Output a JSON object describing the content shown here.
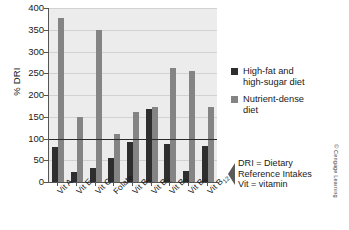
{
  "chart_data": {
    "type": "bar",
    "title": "",
    "xlabel": "",
    "ylabel": "% DRI",
    "ylim": [
      0,
      400
    ],
    "ytick_step": 50,
    "yticks": [
      400,
      350,
      300,
      250,
      200,
      150,
      100,
      50,
      0
    ],
    "grid": true,
    "legend_position": "right",
    "reference_line": {
      "value": 100,
      "label": "100% DRI"
    },
    "categories": [
      "Vit A",
      "Vit E",
      "Vit C",
      "Folate",
      "Vit B1",
      "Vit B2",
      "Vit B3",
      "Vit B6",
      "Vit B12"
    ],
    "category_labels": [
      {
        "base": "Vit A",
        "sub": ""
      },
      {
        "base": "Vit E",
        "sub": ""
      },
      {
        "base": "Vit C",
        "sub": ""
      },
      {
        "base": "Folate",
        "sub": ""
      },
      {
        "base": "Vit B",
        "sub": "1"
      },
      {
        "base": "Vit B",
        "sub": "2"
      },
      {
        "base": "Vit B",
        "sub": "3"
      },
      {
        "base": "Vit B",
        "sub": "6"
      },
      {
        "base": "Vit B",
        "sub": "12"
      }
    ],
    "series": [
      {
        "name": "High-fat and high-sugar diet",
        "color": "#2e2e2e",
        "values": [
          80,
          23,
          33,
          55,
          92,
          167,
          88,
          25,
          83
        ]
      },
      {
        "name": "Nutrient-dense diet",
        "color": "#848484",
        "values": [
          378,
          150,
          350,
          110,
          162,
          172,
          262,
          255,
          172
        ]
      }
    ]
  },
  "legend": {
    "items": [
      {
        "label_line1": "High-fat and",
        "label_line2": "high-sugar diet",
        "color": "#2e2e2e"
      },
      {
        "label_line1": "Nutrient-dense",
        "label_line2": "diet",
        "color": "#848484"
      }
    ]
  },
  "annotation": {
    "line1": "DRI = Dietary",
    "line2": "Reference Intakes",
    "line3": "Vit = vitamin"
  },
  "credit": {
    "text": "© Cengage Learning"
  },
  "caption": {
    "text": ""
  }
}
